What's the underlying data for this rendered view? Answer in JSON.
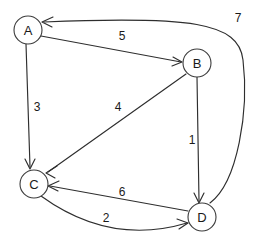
{
  "diagram": {
    "type": "directed-weighted-graph",
    "background_color": "#ffffff",
    "stroke_color": "#2e2e2e",
    "text_color": "#1a1a1a",
    "node_radius": 14,
    "nodes": [
      {
        "id": "A",
        "label": "A",
        "cx": 28,
        "cy": 30
      },
      {
        "id": "B",
        "label": "B",
        "cx": 197,
        "cy": 63
      },
      {
        "id": "C",
        "label": "C",
        "cx": 34,
        "cy": 184
      },
      {
        "id": "D",
        "label": "D",
        "cx": 202,
        "cy": 217
      }
    ],
    "edges": [
      {
        "id": "A-B",
        "from": "A",
        "to": "B",
        "weight": "5",
        "weight_x": 122,
        "weight_y": 36,
        "path": "M 41 36 L 181 62",
        "head": "M 173 57 L 182 62 L 172 66",
        "shape": "straight"
      },
      {
        "id": "A-C",
        "from": "A",
        "to": "C",
        "weight": "3",
        "weight_x": 37,
        "weight_y": 107,
        "path": "M 26 44 L 30 167",
        "head": "M 25 159 L 30 169 L 35 159",
        "shape": "straight"
      },
      {
        "id": "B-C",
        "from": "B",
        "to": "C",
        "weight": "4",
        "weight_x": 118,
        "weight_y": 107,
        "path": "M 186 74 L 48 172",
        "head": "M 57 166 L 46 173 L 55 178",
        "shape": "straight"
      },
      {
        "id": "B-D",
        "from": "B",
        "to": "D",
        "weight": "1",
        "weight_x": 192,
        "weight_y": 140,
        "path": "M 197 77 L 199 201",
        "head": "M 194 193 L 199 203 L 204 193",
        "shape": "straight"
      },
      {
        "id": "D-C",
        "from": "D",
        "to": "C",
        "weight": "6",
        "weight_x": 122,
        "weight_y": 192,
        "path": "M 188 211 L 50 186",
        "head": "M 59 181 L 48 186 L 58 191",
        "shape": "straight"
      },
      {
        "id": "C-D",
        "from": "C",
        "to": "D",
        "weight": "2",
        "weight_x": 106,
        "weight_y": 218,
        "path": "M 41 196 Q 110 246 187 223",
        "head": "M 177 219 L 188 223 L 179 229",
        "shape": "curve"
      },
      {
        "id": "D-A",
        "from": "D",
        "to": "A",
        "weight": "7",
        "weight_x": 238,
        "weight_y": 18,
        "path": "M 210 203 C 238 182 249 110 243 60 C 239 22 190 16 44 22",
        "head": "M 53 17 L 42 22 L 52 27",
        "shape": "curve"
      }
    ]
  }
}
